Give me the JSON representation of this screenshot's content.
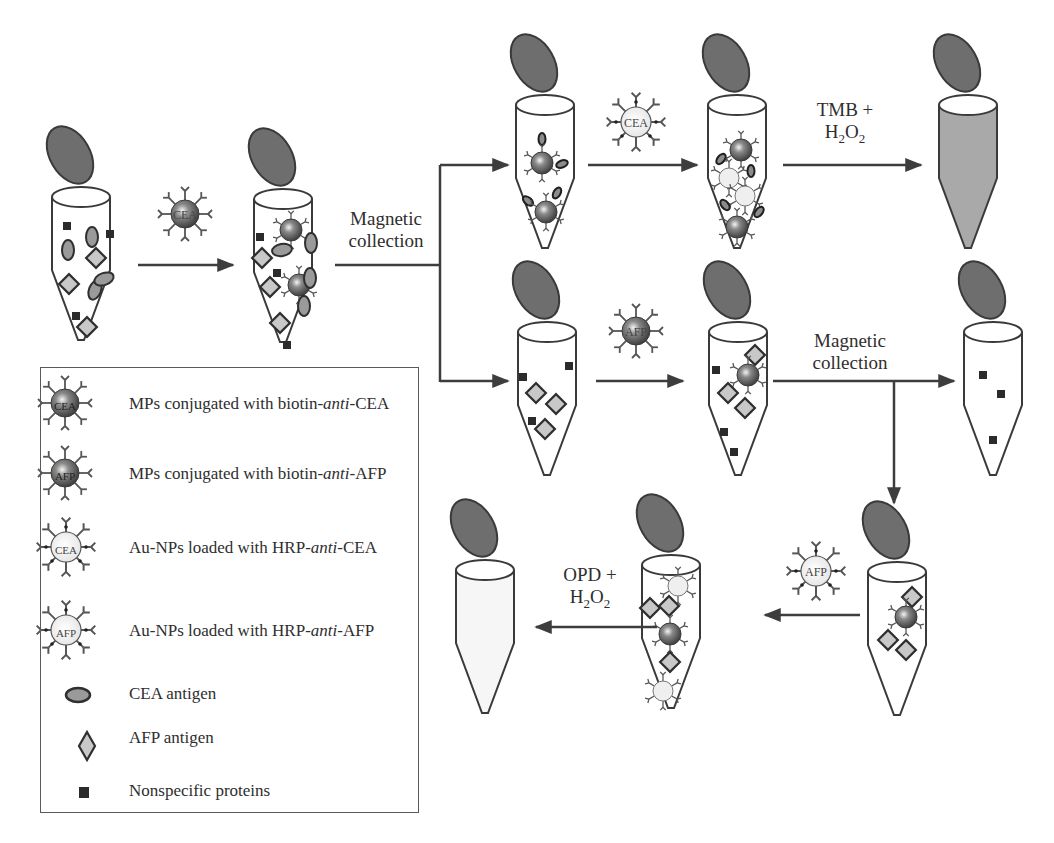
{
  "figure": {
    "labels": {
      "magnetic_collection_1": [
        "Magnetic",
        "collection"
      ],
      "magnetic_collection_2": [
        "Magnetic",
        "collection"
      ],
      "tmb": {
        "line1": "TMB +",
        "line2_prefix": "H",
        "line2_sub1": "2",
        "line2_mid": "O",
        "line2_sub2": "2"
      },
      "opd": {
        "line1": "OPD +",
        "line2_prefix": "H",
        "line2_sub1": "2",
        "line2_mid": "O",
        "line2_sub2": "2"
      }
    },
    "particle_labels": {
      "mp_cea": "CEA",
      "mp_afp": "AFP",
      "au_cea": "CEA",
      "au_afp": "AFP"
    },
    "legend": {
      "items": [
        {
          "icon": "mp-cea-icon",
          "text_before": "MPs conjugated with biotin-",
          "text_italic": "anti",
          "text_after": "-CEA"
        },
        {
          "icon": "mp-afp-icon",
          "text_before": "MPs conjugated with biotin-",
          "text_italic": "anti",
          "text_after": "-AFP"
        },
        {
          "icon": "au-cea-icon",
          "text_before": "Au-NPs loaded with HRP-",
          "text_italic": "anti",
          "text_after": "-CEA"
        },
        {
          "icon": "au-afp-icon",
          "text_before": "Au-NPs loaded with HRP-",
          "text_italic": "anti",
          "text_after": "-AFP"
        },
        {
          "icon": "cea-antigen-icon",
          "text_before": "CEA antigen",
          "text_italic": "",
          "text_after": ""
        },
        {
          "icon": "afp-antigen-icon",
          "text_before": "AFP antigen",
          "text_italic": "",
          "text_after": ""
        },
        {
          "icon": "nonspecific-protein-icon",
          "text_before": "Nonspecific proteins",
          "text_italic": "",
          "text_after": ""
        }
      ]
    },
    "colors": {
      "cap": "#6e6e6e",
      "outline": "#3a3a3a",
      "tmb_fill": "#a9a9a9",
      "antigen_fill": "#9a9a9a",
      "square": "#2b2b2b",
      "arrow": "#3d3d3d"
    }
  }
}
